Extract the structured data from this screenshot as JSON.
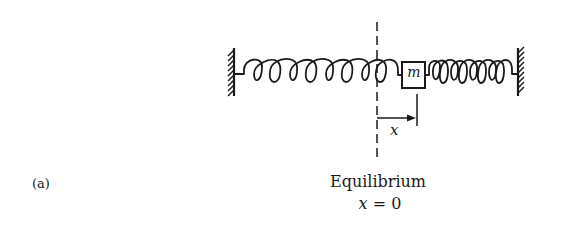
{
  "figure": {
    "part_label": "(a)",
    "mass_label": "m",
    "displacement_label": "x",
    "equilibrium_caption": "Equilibrium",
    "equilibrium_equation": {
      "var": "x",
      "op": " = ",
      "value": "0"
    },
    "colors": {
      "ink": "#1a1a1a",
      "background": "#ffffff"
    },
    "elements": [
      "left-wall-hatched",
      "left-spring-extended",
      "mass-block",
      "right-spring-compressed",
      "right-wall-hatched",
      "equilibrium-dashed-line",
      "displacement-arrow"
    ]
  }
}
